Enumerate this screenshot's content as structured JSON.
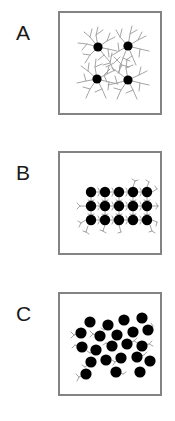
{
  "figure": {
    "background_color": "#ffffff",
    "box_border_color": "#838383",
    "particle_color": "#000000",
    "ligand_color": "#9a9a9a"
  },
  "panels": [
    {
      "label": "A",
      "name": "panel-a",
      "state": "dispersed",
      "description": "Four well-separated nanoparticles with long dense branching ligand shells",
      "particle_count": 4,
      "particle_radius": 4.6,
      "ligand_density": "high",
      "ligand_length": "long",
      "packing": "disordered-dispersed",
      "particles": [
        {
          "x": 38,
          "y": 34
        },
        {
          "x": 68,
          "y": 33
        },
        {
          "x": 37,
          "y": 66
        },
        {
          "x": 68,
          "y": 67
        }
      ]
    },
    {
      "label": "B",
      "name": "panel-b",
      "state": "ordered-superlattice",
      "description": "Fifteen nanoparticles in a close-packed 5 by 3 ordered array linked by short ligands",
      "particle_count": 15,
      "particle_radius": 5.2,
      "ligand_density": "low",
      "ligand_length": "short",
      "packing": "ordered-lattice",
      "grid": {
        "columns": 5,
        "rows": 3,
        "spacing_x": 14,
        "spacing_y": 14
      },
      "particles": [
        {
          "x": 31,
          "y": 39
        },
        {
          "x": 45,
          "y": 39
        },
        {
          "x": 59,
          "y": 39
        },
        {
          "x": 73,
          "y": 39
        },
        {
          "x": 87,
          "y": 39
        },
        {
          "x": 31,
          "y": 53
        },
        {
          "x": 45,
          "y": 53
        },
        {
          "x": 59,
          "y": 53
        },
        {
          "x": 73,
          "y": 53
        },
        {
          "x": 87,
          "y": 53
        },
        {
          "x": 31,
          "y": 67
        },
        {
          "x": 45,
          "y": 67
        },
        {
          "x": 59,
          "y": 67
        },
        {
          "x": 73,
          "y": 67
        },
        {
          "x": 87,
          "y": 67
        }
      ]
    },
    {
      "label": "C",
      "name": "panel-c",
      "state": "aggregated-disordered",
      "description": "Twenty-two nanoparticles randomly distributed with sparse short ligand stubs",
      "particle_count": 22,
      "particle_radius": 5.6,
      "ligand_density": "sparse",
      "ligand_length": "short",
      "packing": "random-aggregate",
      "particles": [
        {
          "x": 30,
          "y": 28
        },
        {
          "x": 48,
          "y": 31
        },
        {
          "x": 64,
          "y": 26
        },
        {
          "x": 82,
          "y": 24
        },
        {
          "x": 21,
          "y": 39
        },
        {
          "x": 40,
          "y": 42
        },
        {
          "x": 57,
          "y": 41
        },
        {
          "x": 73,
          "y": 38
        },
        {
          "x": 88,
          "y": 36
        },
        {
          "x": 22,
          "y": 53
        },
        {
          "x": 36,
          "y": 56
        },
        {
          "x": 52,
          "y": 52
        },
        {
          "x": 67,
          "y": 50
        },
        {
          "x": 82,
          "y": 52
        },
        {
          "x": 31,
          "y": 68
        },
        {
          "x": 46,
          "y": 66
        },
        {
          "x": 61,
          "y": 64
        },
        {
          "x": 77,
          "y": 63
        },
        {
          "x": 90,
          "y": 67
        },
        {
          "x": 26,
          "y": 80
        },
        {
          "x": 56,
          "y": 78
        },
        {
          "x": 80,
          "y": 78
        }
      ]
    }
  ]
}
